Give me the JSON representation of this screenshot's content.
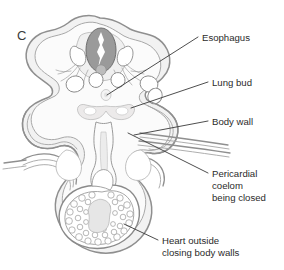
{
  "figure": {
    "panel_letter": "C",
    "caption_subject": "embryo transverse section",
    "background_color": "#ffffff",
    "ink_color": "#2b2b2b",
    "outline_color": "#8f8f8f",
    "fill_color": "#f2f2f2",
    "neural_tube_color": "#9a9a9a",
    "width": 284,
    "height": 270
  },
  "labels": [
    {
      "id": "esophagus",
      "text": "Esophagus",
      "text_x": 202,
      "text_y": 40,
      "leader": {
        "x1": 198,
        "y1": 37,
        "x2": 107,
        "y2": 95
      }
    },
    {
      "id": "lung-bud",
      "text": "Lung bud",
      "text_x": 212,
      "text_y": 85,
      "leader": {
        "x1": 208,
        "y1": 82,
        "x2": 131,
        "y2": 108
      }
    },
    {
      "id": "body-wall",
      "text": "Body wall",
      "text_x": 212,
      "text_y": 124,
      "leader": {
        "x1": 208,
        "y1": 121,
        "x2": 134,
        "y2": 135
      }
    },
    {
      "id": "pericardial-coelom",
      "text_lines": [
        "Pericardial",
        "coelom",
        "being closed"
      ],
      "text_x": 212,
      "text_y": 176,
      "leader": {
        "x1": 208,
        "y1": 173,
        "x2": 128,
        "y2": 133
      }
    },
    {
      "id": "heart-outside",
      "text_lines": [
        "Heart outside",
        "closing body walls"
      ],
      "text_x": 162,
      "text_y": 243,
      "leader": {
        "x1": 158,
        "y1": 240,
        "x2": 124,
        "y2": 224
      }
    }
  ],
  "structures": [
    {
      "id": "neural-tube",
      "name": "Neural tube",
      "shade": "#9a9a9a"
    },
    {
      "id": "neural-lumen",
      "name": "Neural canal",
      "shade": "#ffffff"
    },
    {
      "id": "somite-left",
      "name": "Left somite",
      "shade": "#ffffff"
    },
    {
      "id": "somite-right",
      "name": "Right somite",
      "shade": "#ffffff"
    },
    {
      "id": "dorsal-aorta",
      "name": "Dorsal aorta",
      "shade": "#b8b8b8"
    },
    {
      "id": "esophagus-lumen",
      "name": "Esophagus",
      "shade": "#f4f4f4"
    },
    {
      "id": "lung-buds",
      "name": "Lung buds",
      "shade": "#eceaea"
    },
    {
      "id": "body-wall-left",
      "name": "Left body wall fold",
      "shade": "#f2f2f2"
    },
    {
      "id": "body-wall-right",
      "name": "Right body wall fold",
      "shade": "#f2f2f2"
    },
    {
      "id": "pericardial-coelom-space",
      "name": "Pericardial coelom",
      "shade": "#ffffff"
    },
    {
      "id": "heart",
      "name": "Heart",
      "shade": "#ffffff"
    },
    {
      "id": "heart-trabeculae",
      "name": "Cardiac trabeculae",
      "shade": "#ffffff"
    },
    {
      "id": "amnion-folds",
      "name": "Amniotic folds",
      "shade": "#8f8f8f"
    }
  ]
}
